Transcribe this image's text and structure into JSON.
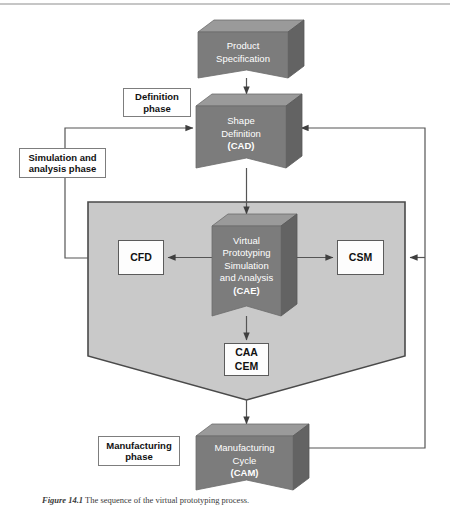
{
  "figure": {
    "caption_lead": "Figure 14.1",
    "caption_text": "The sequence of the virtual prototyping process."
  },
  "colors": {
    "block_front": "#7c7c7c",
    "block_top": "#9a9a9a",
    "block_side": "#636363",
    "region_fill": "#c9c9c9",
    "region_border": "#4a4a4a",
    "line": "#555555",
    "box_fill": "#fdfdfd",
    "box_border": "#5b5b5b",
    "text_on_block": "#ffffff",
    "page_bg": "#ffffff"
  },
  "blocks": {
    "product_specification": {
      "lines": [
        "Product",
        "Specification"
      ],
      "bold": [
        false,
        false
      ]
    },
    "shape_definition": {
      "lines": [
        "Shape",
        "Definition",
        "(CAD)"
      ],
      "bold": [
        false,
        false,
        true
      ]
    },
    "virtual_prototyping": {
      "lines": [
        "Virtual",
        "Prototyping",
        "Simulation",
        "and Analysis",
        "(CAE)"
      ],
      "bold": [
        false,
        false,
        false,
        false,
        true
      ]
    },
    "manufacturing_cycle": {
      "lines": [
        "Manufacturing",
        "Cycle",
        "(CAM)"
      ],
      "bold": [
        false,
        false,
        true
      ]
    }
  },
  "phase_labels": {
    "definition": "Definition\nphase",
    "definition_l1": "Definition",
    "definition_l2": "phase",
    "simulation": "Simulation and\nanalysis phase",
    "simulation_l1": "Simulation and",
    "simulation_l2": "analysis phase",
    "manufacturing": "Manufacturing\nphase",
    "manufacturing_l1": "Manufacturing",
    "manufacturing_l2": "phase"
  },
  "solid_boxes": {
    "cfd": "CFD",
    "csm": "CSM",
    "caa_cem_l1": "CAA",
    "caa_cem_l2": "CEM"
  },
  "region": {
    "name": "simulation-and-analysis-region"
  },
  "connectors": [
    {
      "name": "spec-to-cad",
      "from": "product_specification",
      "to": "shape_definition",
      "direction": "down"
    },
    {
      "name": "cad-to-cae",
      "from": "shape_definition",
      "to": "virtual_prototyping",
      "direction": "down"
    },
    {
      "name": "cae-to-cfd",
      "from": "virtual_prototyping",
      "to": "cfd",
      "direction": "left"
    },
    {
      "name": "cae-to-csm",
      "from": "virtual_prototyping",
      "to": "csm",
      "direction": "right"
    },
    {
      "name": "cae-to-caa-cem",
      "from": "virtual_prototyping",
      "to": "caa_cem",
      "direction": "down"
    },
    {
      "name": "region-to-cam",
      "from": "region",
      "to": "manufacturing_cycle",
      "direction": "down"
    },
    {
      "name": "feedback-left-to-cad",
      "from": "region_left",
      "to": "shape_definition",
      "direction": "loop-left"
    },
    {
      "name": "feedback-right-to-cad",
      "from": "manufacturing_cycle",
      "to": "shape_definition",
      "direction": "loop-right"
    },
    {
      "name": "feedback-right-to-region",
      "from": "manufacturing_cycle",
      "to": "region",
      "direction": "loop-right"
    }
  ]
}
